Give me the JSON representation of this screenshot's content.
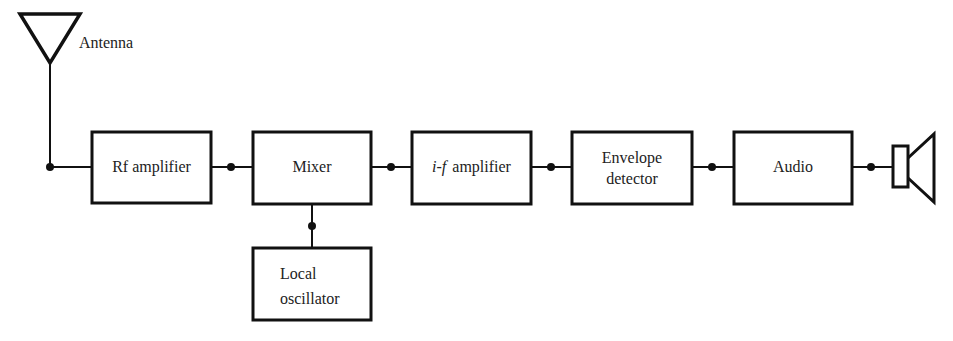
{
  "diagram": {
    "type": "block-diagram",
    "title": "",
    "antenna": {
      "label": "Antenna"
    },
    "blocks": [
      {
        "id": "rf",
        "lines": [
          "Rf amplifier"
        ]
      },
      {
        "id": "mixer",
        "lines": [
          "Mixer"
        ]
      },
      {
        "id": "if",
        "prefix": "i-f",
        "lines": [
          "amplifier"
        ]
      },
      {
        "id": "env",
        "lines": [
          "Envelope",
          "detector"
        ]
      },
      {
        "id": "audio",
        "lines": [
          "Audio"
        ]
      },
      {
        "id": "lo",
        "lines": [
          "Local",
          "oscillator"
        ]
      }
    ],
    "output": {
      "icon": "speaker-icon"
    },
    "connections": [
      [
        "antenna",
        "rf"
      ],
      [
        "rf",
        "mixer"
      ],
      [
        "lo",
        "mixer"
      ],
      [
        "mixer",
        "if"
      ],
      [
        "if",
        "env"
      ],
      [
        "env",
        "audio"
      ],
      [
        "audio",
        "speaker"
      ]
    ]
  }
}
